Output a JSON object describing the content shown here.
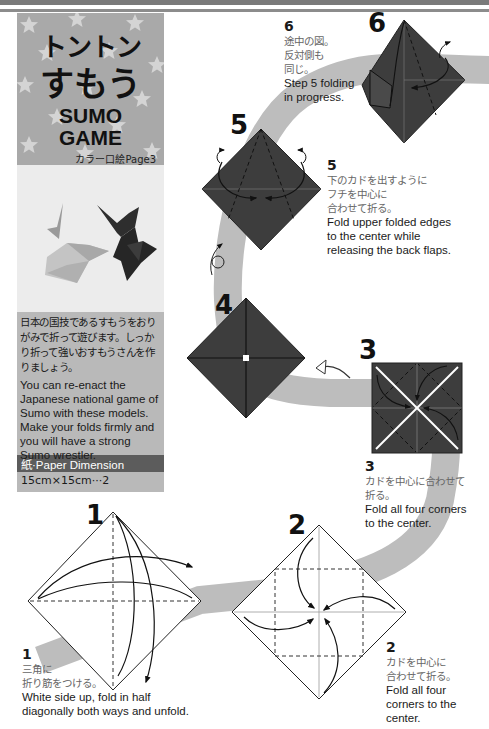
{
  "header": {
    "title_jp_line1": "トントン",
    "title_jp_line2": "すもう",
    "title_en_line1": "SUMO",
    "title_en_line2": "GAME",
    "color_page_ref": "カラー口絵Page3"
  },
  "description": {
    "jp": "日本の国技であるすもうをおりがみで折って遊びます。しっかり折って強いおすもうさんを作りましょう。",
    "en": "You can re-enact the Japanese national game of Sumo with these models. Make your folds firmly and you will have a strong Sumo wrestler."
  },
  "paper": {
    "label": "紙·Paper Dimension",
    "value": "15cm×15cm···2"
  },
  "colors": {
    "model_dark": "#3d3d3d",
    "path_gray": "#bdbdbd",
    "panel_gray": "#b9b9b9",
    "title_bg": "#a9a9a9"
  },
  "steps": [
    {
      "number": "1",
      "jp": "三角に\n折り筋をつける。",
      "en": "White side up, fold in half\ndiagonally both ways and unfold."
    },
    {
      "number": "2",
      "jp": "カドを中心に\n合わせて折る。",
      "en": "Fold all four\ncorners to the\ncenter."
    },
    {
      "number": "3",
      "jp": "カドを中心に合わせて\n折る。",
      "en": "Fold all four corners\nto the center."
    },
    {
      "number": "4"
    },
    {
      "number": "5",
      "jp": "下のカドを出すように\nフチを中心に\n合わせて折る。",
      "en": "Fold upper folded edges\nto the center while\nreleasing the back flaps."
    },
    {
      "number": "6",
      "jp": "途中の図。\n反対側も\n同じ。",
      "en": "Step 5 folding\nin progress."
    }
  ]
}
